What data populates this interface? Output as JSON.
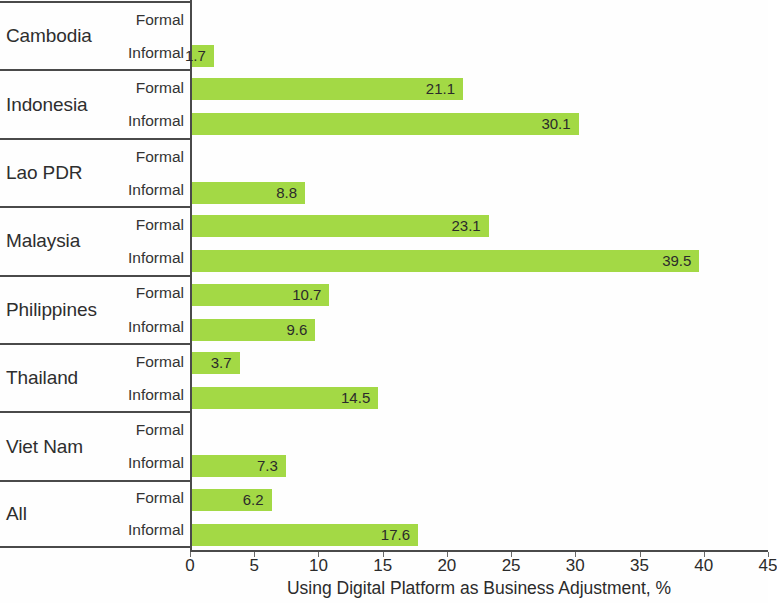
{
  "chart_data": {
    "type": "bar",
    "orientation": "horizontal",
    "title": "",
    "subtitle": "",
    "xlabel": "Using Digital Platform as Business Adjustment, %",
    "ylabel": "",
    "xlim": [
      0,
      45
    ],
    "xticks": [
      0,
      5,
      10,
      15,
      20,
      25,
      30,
      35,
      40,
      45
    ],
    "xtick_labels": [
      "0",
      "5",
      "10",
      "15",
      "20",
      "25",
      "30",
      "35",
      "40",
      "45"
    ],
    "grid": false,
    "legend": null,
    "bar_color": "#a3d945",
    "categories": [
      "Cambodia",
      "Indonesia",
      "Lao PDR",
      "Malaysia",
      "Philippines",
      "Thailand",
      "Viet Nam",
      "All"
    ],
    "subcategories": [
      "Formal",
      "Informal"
    ],
    "series": [
      {
        "name": "Formal",
        "values": [
          0,
          21.1,
          0,
          23.1,
          10.7,
          3.7,
          0,
          6.2
        ]
      },
      {
        "name": "Informal",
        "values": [
          1.7,
          30.1,
          8.8,
          39.5,
          9.6,
          14.5,
          7.3,
          17.6
        ]
      }
    ],
    "groups": [
      {
        "category": "Cambodia",
        "bars": [
          {
            "sector": "Formal",
            "value": 0,
            "label": ""
          },
          {
            "sector": "Informal",
            "value": 1.7,
            "label": "1.7"
          }
        ]
      },
      {
        "category": "Indonesia",
        "bars": [
          {
            "sector": "Formal",
            "value": 21.1,
            "label": "21.1"
          },
          {
            "sector": "Informal",
            "value": 30.1,
            "label": "30.1"
          }
        ]
      },
      {
        "category": "Lao PDR",
        "bars": [
          {
            "sector": "Formal",
            "value": 0,
            "label": ""
          },
          {
            "sector": "Informal",
            "value": 8.8,
            "label": "8.8"
          }
        ]
      },
      {
        "category": "Malaysia",
        "bars": [
          {
            "sector": "Formal",
            "value": 23.1,
            "label": "23.1"
          },
          {
            "sector": "Informal",
            "value": 39.5,
            "label": "39.5"
          }
        ]
      },
      {
        "category": "Philippines",
        "bars": [
          {
            "sector": "Formal",
            "value": 10.7,
            "label": "10.7"
          },
          {
            "sector": "Informal",
            "value": 9.6,
            "label": "9.6"
          }
        ]
      },
      {
        "category": "Thailand",
        "bars": [
          {
            "sector": "Formal",
            "value": 3.7,
            "label": "3.7"
          },
          {
            "sector": "Informal",
            "value": 14.5,
            "label": "14.5"
          }
        ]
      },
      {
        "category": "Viet Nam",
        "bars": [
          {
            "sector": "Formal",
            "value": 0,
            "label": ""
          },
          {
            "sector": "Informal",
            "value": 7.3,
            "label": "7.3"
          }
        ]
      },
      {
        "category": "All",
        "bars": [
          {
            "sector": "Formal",
            "value": 6.2,
            "label": "6.2"
          },
          {
            "sector": "Informal",
            "value": 17.6,
            "label": "17.6"
          }
        ]
      }
    ]
  }
}
